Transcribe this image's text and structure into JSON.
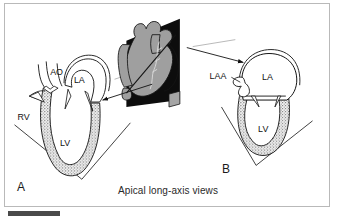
{
  "figure": {
    "caption": "Apical long-axis views",
    "background_color": "#ffffff",
    "border_color": "#b9b9b9",
    "ink_color": "#111111",
    "myocardium_fill": "#a8a8a8",
    "heart_body_fill": "#9f9f9f",
    "cut_plane_fill": "#0d0d0d"
  },
  "panels": [
    {
      "id": "A",
      "letter": "A",
      "view": "apical-long-axis-left",
      "labels": [
        {
          "text": "AO",
          "name": "aorta",
          "x": 45,
          "y": 68
        },
        {
          "text": "LA",
          "name": "left-atrium",
          "x": 72,
          "y": 75
        },
        {
          "text": "RV",
          "name": "right-ventricle",
          "x": 13,
          "y": 112
        },
        {
          "text": "LV",
          "name": "left-ventricle",
          "x": 56,
          "y": 139
        }
      ]
    },
    {
      "id": "B",
      "letter": "B",
      "view": "apical-long-axis-right",
      "labels": [
        {
          "text": "LAA",
          "name": "left-atrial-appendage",
          "x": 212,
          "y": 72
        },
        {
          "text": "LA",
          "name": "left-atrium",
          "x": 263,
          "y": 71
        },
        {
          "text": "LV",
          "name": "left-ventricle",
          "x": 260,
          "y": 126
        }
      ]
    }
  ],
  "center_diagram": {
    "name": "three-dimensional-heart-with-cut-plane",
    "description": "Shaded anatomical heart with a black imaging plane slicing through it"
  },
  "arrows": [
    {
      "name": "arrow-to-panel-a",
      "from_x": 150,
      "from_y": 82,
      "to_x": 99,
      "to_y": 97
    },
    {
      "name": "arrow-to-panel-b",
      "from_x": 186,
      "from_y": 47,
      "to_x": 243,
      "to_y": 60
    }
  ],
  "bottom_bar": {
    "name": "page-footer-bar",
    "color": "#4a4a4a"
  }
}
